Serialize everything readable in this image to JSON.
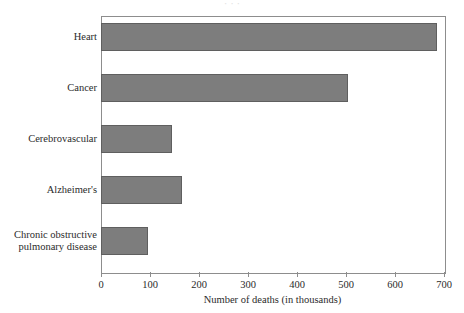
{
  "chart_data": {
    "type": "bar",
    "orientation": "horizontal",
    "title": "",
    "xlabel": "Number of deaths (in thousands)",
    "ylabel": "",
    "categories": [
      "Heart",
      "Cancer",
      "Cerebrovascular",
      "Alzheimer's",
      "Chronic obstructive\npulmonary disease"
    ],
    "values": [
      685,
      505,
      145,
      165,
      95
    ],
    "xlim": [
      0,
      700
    ],
    "xticks": [
      0,
      100,
      200,
      300,
      400,
      500,
      600,
      700
    ],
    "xticklabels": [
      "0",
      "100",
      "200",
      "300",
      "400",
      "500",
      "600",
      "700"
    ],
    "grid": false,
    "legend": null,
    "bar_color": "#7d7d7d",
    "bar_edge_color": "#5f5f5f",
    "axis_color": "#8d8d8d",
    "background_color": "#ffffff",
    "text_color": "#2b2b2b"
  },
  "cropped_title_sliver": "· · ·"
}
